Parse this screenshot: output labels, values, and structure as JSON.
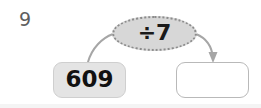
{
  "worksheet": {
    "question_number": "9",
    "diagram_type": "function-machine",
    "operation": {
      "symbol": "÷7",
      "operator": "÷",
      "operand": "7"
    },
    "input": {
      "label": "609",
      "filled": true
    },
    "output": {
      "label": "",
      "placeholder": "",
      "filled": false
    },
    "arrows": [
      {
        "name": "input-to-operation",
        "has_arrowhead": false
      },
      {
        "name": "operation-to-output",
        "has_arrowhead": true
      }
    ],
    "colors": {
      "question_number": "#5e5e5e",
      "oval_fill": "#d7d7d7",
      "oval_border": "#8c8c8c",
      "input_fill": "#e4e4e4",
      "input_border": "#cfcfcf",
      "answer_fill": "#ffffff",
      "answer_border": "#b9b9b9",
      "arrow": "#a6a6a6",
      "text": "#111111",
      "background": "#ffffff"
    }
  }
}
